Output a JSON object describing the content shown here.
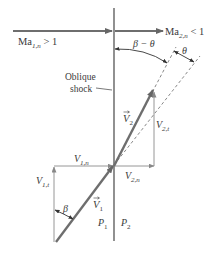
{
  "figure": {
    "type": "oblique shock velocity diagram",
    "colors": {
      "shock_line": "#555555",
      "velocity_arrow": "#6e6e6e",
      "component_line": "#8a8a8a",
      "dashed": "#7a7a7a",
      "text": "#3a3a3a",
      "background": "#ffffff"
    }
  },
  "labels": {
    "ma1": {
      "base": "Ma",
      "sub": "1,n",
      "rel": " > 1"
    },
    "ma2": {
      "base": "Ma",
      "sub": "2,n",
      "rel": " < 1"
    },
    "shock_line1": "Oblique",
    "shock_line2": "shock",
    "beta_minus_theta": "β − θ",
    "theta": "θ",
    "beta": "β",
    "v1": {
      "base": "V",
      "sub": "1"
    },
    "v2": {
      "base": "V",
      "sub": "2"
    },
    "v1n": {
      "base": "V",
      "sub": "1,n"
    },
    "v1t": {
      "base": "V",
      "sub": "1,t"
    },
    "v2n": {
      "base": "V",
      "sub": "2,n"
    },
    "v2t": {
      "base": "V",
      "sub": "2,t"
    },
    "p1": {
      "base": "P",
      "sub": "1"
    },
    "p2": {
      "base": "P",
      "sub": "2"
    }
  }
}
